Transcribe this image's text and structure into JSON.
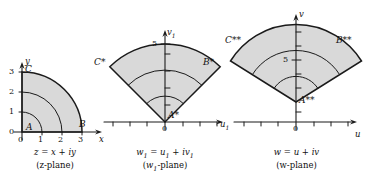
{
  "figure": {
    "fill_color": "#d9d9d9",
    "stroke_color": "#1a1a1a"
  },
  "panels": [
    {
      "id": "z-plane",
      "caption_formula": "z = x + iy",
      "caption_plane": "(z-plane)",
      "axis_x_label": "x",
      "axis_y_label": "y",
      "x_ticks": [
        "0",
        "1",
        "2",
        "3"
      ],
      "y_ticks": [
        "0",
        "1",
        "2",
        "3"
      ],
      "points": [
        {
          "name": "A",
          "label": "A"
        },
        {
          "name": "B",
          "label": "B"
        },
        {
          "name": "C",
          "label": "C"
        }
      ],
      "region": "quarter disc in first quadrant, radius 3, with concentric arcs at radii 1, 2, 3"
    },
    {
      "id": "w1-plane",
      "caption_formula": "w₁ = u₁ + iv₁",
      "caption_plane": "(w₁-plane)",
      "axis_x_label": "u₁",
      "axis_y_label": "v₁",
      "x_ticks": [
        "0"
      ],
      "y_ticks": [
        "5"
      ],
      "points": [
        {
          "name": "A-star",
          "label": "A*"
        },
        {
          "name": "B-star",
          "label": "B*"
        },
        {
          "name": "C-star",
          "label": "C*"
        }
      ],
      "region": "circular sector apex at origin, opening upward, half-angle about 45 degrees, with concentric arcs"
    },
    {
      "id": "w-plane",
      "caption_formula": "w = u + iv",
      "caption_plane": "(w-plane)",
      "axis_x_label": "u",
      "axis_y_label": "v",
      "x_ticks": [
        "0"
      ],
      "y_ticks": [
        "5"
      ],
      "points": [
        {
          "name": "A-double-star",
          "label": "A**"
        },
        {
          "name": "B-double-star",
          "label": "B**"
        },
        {
          "name": "C-double-star",
          "label": "C**"
        }
      ],
      "region": "wider circular sector apex above origin, opening upward, half-angle about 60 degrees, with concentric arcs"
    }
  ]
}
